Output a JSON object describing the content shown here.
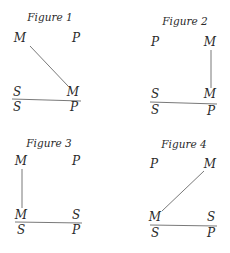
{
  "figures": [
    {
      "title": "Figure 1",
      "major_premise": {
        "left": "M",
        "right": "P"
      },
      "minor_premise": {
        "left": "S",
        "right": "M"
      },
      "conclusion": {
        "left": "S",
        "right": "P"
      },
      "connector": "major-left-to-minor-right"
    },
    {
      "title": "Figure 2",
      "major_premise": {
        "left": "P",
        "right": "M"
      },
      "minor_premise": {
        "left": "S",
        "right": "M"
      },
      "conclusion": {
        "left": "S",
        "right": "P"
      },
      "connector": "major-right-to-minor-right"
    },
    {
      "title": "Figure 3",
      "major_premise": {
        "left": "M",
        "right": "P"
      },
      "minor_premise": {
        "left": "M",
        "right": "S"
      },
      "conclusion": {
        "left": "S",
        "right": "P"
      },
      "connector": "major-left-to-minor-left"
    },
    {
      "title": "Figure 4",
      "major_premise": {
        "left": "P",
        "right": "M"
      },
      "minor_premise": {
        "left": "M",
        "right": "S"
      },
      "conclusion": {
        "left": "S",
        "right": "P"
      },
      "connector": "major-right-to-minor-left"
    }
  ]
}
